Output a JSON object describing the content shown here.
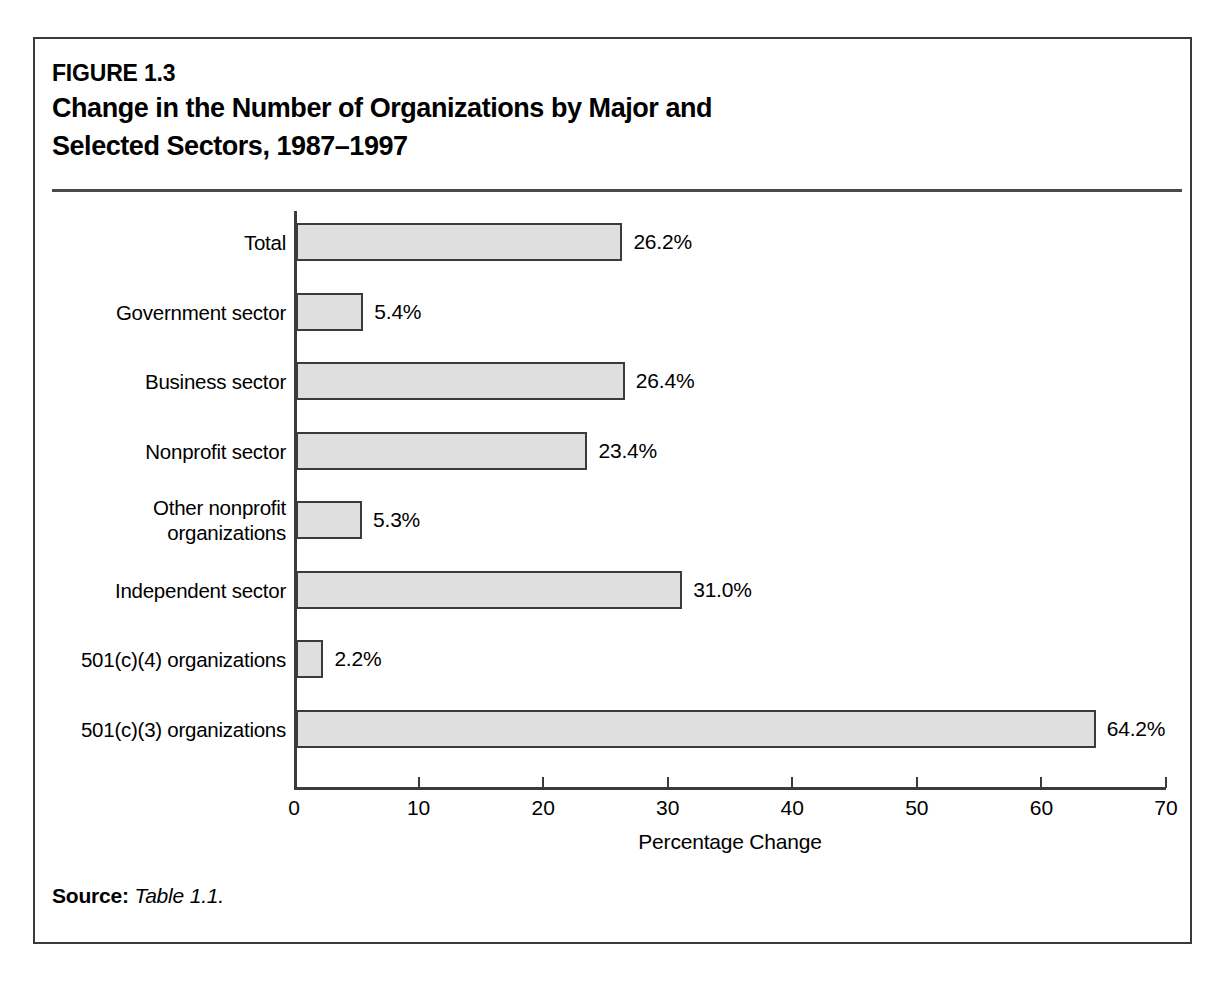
{
  "figure": {
    "number": "FIGURE 1.3",
    "title_line1": "Change in the Number of Organizations by Major and",
    "title_line2": "Selected Sectors, 1987–1997",
    "source_label": "Source:",
    "source_value": "Table 1.1."
  },
  "chart_data": {
    "type": "bar",
    "orientation": "horizontal",
    "title": "Change in the Number of Organizations by Major and Selected Sectors, 1987–1997",
    "xlabel": "Percentage Change",
    "ylabel": "",
    "xlim": [
      0,
      70
    ],
    "xticks": [
      0,
      10,
      20,
      30,
      40,
      50,
      60,
      70
    ],
    "xtick_labels": [
      "0",
      "10",
      "20",
      "30",
      "40",
      "50",
      "60",
      "70"
    ],
    "grid": false,
    "legend": null,
    "bar_fill_color": "#dfdfdf",
    "bar_edge_color": "#3b3b3b",
    "categories": [
      "Total",
      "Government sector",
      "Business sector",
      "Nonprofit sector",
      "Other nonprofit\norganizations",
      "Independent sector",
      "501(c)(4) organizations",
      "501(c)(3) organizations"
    ],
    "values": [
      26.2,
      5.4,
      26.4,
      23.4,
      5.3,
      31.0,
      2.2,
      64.2
    ],
    "data_labels": [
      "26.2%",
      "5.4%",
      "26.4%",
      "23.4%",
      "5.3%",
      "31.0%",
      "2.2%",
      "64.2%"
    ]
  }
}
